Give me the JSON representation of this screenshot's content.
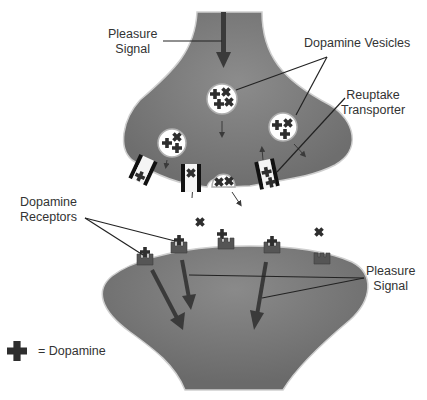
{
  "labels": {
    "pleasure_signal_top": [
      "Pleasure",
      "Signal"
    ],
    "dopamine_vesicles": "Dopamine Vesicles",
    "reuptake_transporter": [
      "Reuptake",
      "Transporter"
    ],
    "dopamine_receptors": [
      "Dopamine",
      "Receptors"
    ],
    "pleasure_signal_bottom": [
      "Pleasure",
      "Signal"
    ]
  },
  "legend": {
    "symbol": "dopamine-cross",
    "text": "= Dopamine"
  },
  "colors": {
    "neuron_fill": "#7d7d7d",
    "neuron_outline": "#c8c8c8",
    "arrow": "#3a3a3a",
    "dopamine": "#2e2e2e",
    "receptor": "#555555",
    "transporter": "#111111",
    "text": "#333333"
  }
}
